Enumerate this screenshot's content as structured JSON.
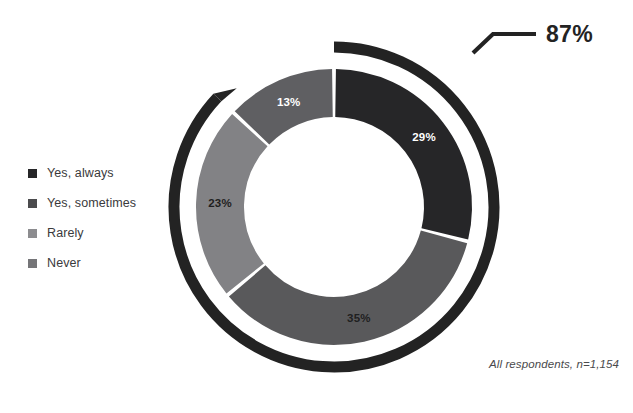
{
  "legend": {
    "items": [
      {
        "label": "Yes, always",
        "color": "#262628"
      },
      {
        "label": "Yes, sometimes",
        "color": "#4b4b4d"
      },
      {
        "label": "Rarely",
        "color": "#8c8c8f"
      },
      {
        "label": "Never",
        "color": "#757578"
      }
    ]
  },
  "callout": {
    "value": "87%"
  },
  "footnote": {
    "text": "All respondents, n=1,154"
  },
  "chart_data": {
    "type": "pie",
    "variant": "donut",
    "title": "",
    "xlabel": "",
    "ylabel": "",
    "legend_position": "left",
    "grid": false,
    "start_angle_deg": 0,
    "direction": "clockwise",
    "total_label": "87%",
    "total_value": 87,
    "outer_arc_sweep_deg": 313.2,
    "categories": [
      "Yes, always",
      "Yes, sometimes",
      "Rarely",
      "Never"
    ],
    "values": [
      29,
      35,
      23,
      13
    ],
    "value_labels": [
      "29%",
      "35%",
      "23%",
      "13%"
    ],
    "slice_colors": [
      "#262628",
      "#59595b",
      "#828285",
      "#5f5f62"
    ],
    "slice_label_colors": [
      "#ffffff",
      "#1f1f21",
      "#1f1f21",
      "#ffffff"
    ],
    "annotations": [
      "87%",
      "All respondents, n=1,154"
    ]
  }
}
